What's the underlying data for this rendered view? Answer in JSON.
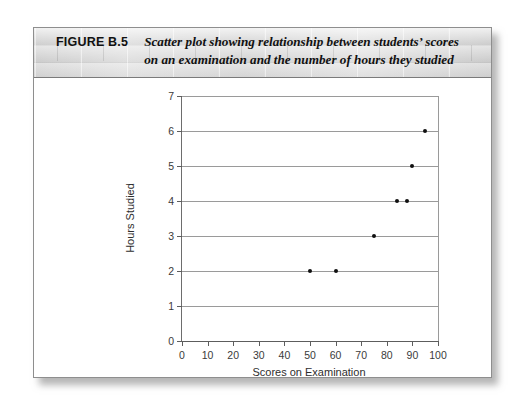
{
  "figure": {
    "number_label": "FIGURE B.5",
    "caption_line1": "Scatter plot showing relationship between students’ scores",
    "caption_line2": "on an examination and the number of hours they studied"
  },
  "chart_data": {
    "type": "scatter",
    "title": "",
    "xlabel": "Scores on Examination",
    "ylabel": "Hours Studied",
    "xlim": [
      0,
      100
    ],
    "ylim": [
      0,
      7
    ],
    "xticks": [
      0,
      10,
      20,
      30,
      40,
      50,
      60,
      70,
      80,
      90,
      100
    ],
    "yticks": [
      0,
      1,
      2,
      3,
      4,
      5,
      6,
      7
    ],
    "xtick_labels": [
      "0",
      "10",
      "20",
      "30",
      "40",
      "50",
      "60",
      "70",
      "80",
      "90",
      "100"
    ],
    "ytick_labels": [
      "0",
      "1",
      "2",
      "3",
      "4",
      "5",
      "6",
      "7"
    ],
    "grid": "horizontal",
    "legend": "none",
    "marker_color": "#101010",
    "gridline_color": "#9a9a9a",
    "points": [
      {
        "x": 50,
        "y": 2
      },
      {
        "x": 60,
        "y": 2
      },
      {
        "x": 75,
        "y": 3
      },
      {
        "x": 84,
        "y": 4
      },
      {
        "x": 88,
        "y": 4
      },
      {
        "x": 90,
        "y": 5
      },
      {
        "x": 95,
        "y": 6
      }
    ]
  }
}
